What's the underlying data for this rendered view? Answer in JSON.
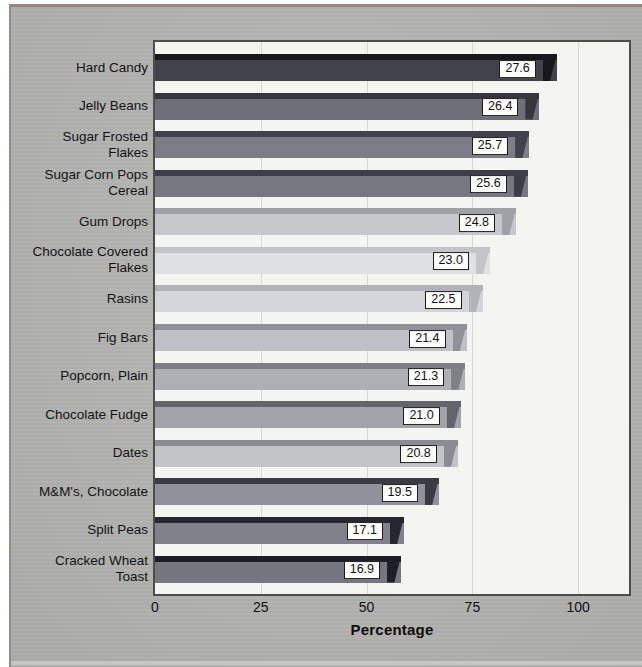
{
  "panel": {
    "background": "#b5b5b2",
    "top_edge_color": "#97867e",
    "left_edge_color": "#8e8e8b",
    "bottom_edge_color": "#cdcdc9"
  },
  "plot": {
    "background": "#f4f4f1",
    "border_color": "#4e4e48",
    "gridline_color": "#d7d7d3",
    "value_box_background": "#fcfcfa",
    "value_box_border": "#1b1b1b"
  },
  "chart_data": {
    "type": "bar",
    "orientation": "horizontal",
    "title": "",
    "xlabel": "Percentage",
    "ylabel": "",
    "x_ticks": [
      "0",
      "25",
      "50",
      "75",
      "100"
    ],
    "x_tick_values": [
      0,
      25,
      50,
      75,
      100
    ],
    "xlim": [
      0,
      112
    ],
    "grid": "vertical gridlines at each x tick",
    "legend": "none",
    "bar_value_to_axis_scale": 3.44,
    "categories": [
      "Hard Candy",
      "Jelly Beans",
      "Sugar Frosted\nFlakes",
      "Sugar Corn Pops\nCereal",
      "Gum Drops",
      "Chocolate Covered\nFlakes",
      "Rasins",
      "Fig Bars",
      "Popcorn, Plain",
      "Chocolate Fudge",
      "Dates",
      "M&M's, Chocolate",
      "Split Peas",
      "Cracked Wheat\nToast"
    ],
    "values": [
      27.6,
      26.4,
      25.7,
      25.6,
      24.8,
      23.0,
      22.5,
      21.4,
      21.3,
      21.0,
      20.8,
      19.5,
      17.1,
      16.9
    ],
    "value_labels": [
      "27.6",
      "26.4",
      "25.7",
      "25.6",
      "24.8",
      "23.0",
      "22.5",
      "21.4",
      "21.3",
      "21.0",
      "20.8",
      "19.5",
      "17.1",
      "16.9"
    ],
    "bar_colors": [
      {
        "top": "#17171c",
        "body": "#42424b"
      },
      {
        "top": "#35353e",
        "body": "#6e6e78"
      },
      {
        "top": "#42424c",
        "body": "#7d7d87"
      },
      {
        "top": "#3e3e48",
        "body": "#777781"
      },
      {
        "top": "#a0a1a7",
        "body": "#c7c8cc"
      },
      {
        "top": "#c4c5c9",
        "body": "#e0e1e3"
      },
      {
        "top": "#b2b3b8",
        "body": "#d4d5d8"
      },
      {
        "top": "#909198",
        "body": "#c0c1c6"
      },
      {
        "top": "#7f8087",
        "body": "#afb0b6"
      },
      {
        "top": "#64656c",
        "body": "#a3a4aa"
      },
      {
        "top": "#8b8c92",
        "body": "#c3c4c8"
      },
      {
        "top": "#3b3b43",
        "body": "#90919a"
      },
      {
        "top": "#27272f",
        "body": "#80818a"
      },
      {
        "top": "#1e1e26",
        "body": "#757680"
      }
    ]
  }
}
